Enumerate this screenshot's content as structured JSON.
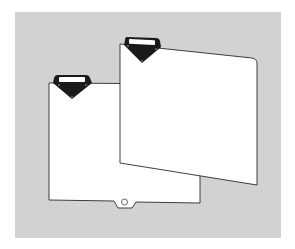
{
  "illustration": {
    "subject": "two file divider sheets with tab holders",
    "colors": {
      "page_background": "#ffffff",
      "panel_background": "#d2d2d2",
      "sheet_fill": "#ffffff",
      "sheet_stroke": "#2a2a2a",
      "tab_fill": "#1a1a1a",
      "tab_window": "#ffffff"
    },
    "items": [
      {
        "name": "back-divider-sheet",
        "has_bottom_notch": true,
        "has_hole": true
      },
      {
        "name": "front-divider-sheet",
        "tilted": true
      }
    ]
  }
}
